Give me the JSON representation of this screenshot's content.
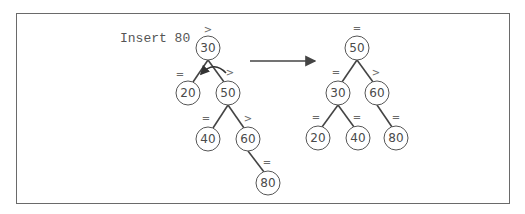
{
  "caption": "Insert 80",
  "colors": {
    "node_stroke": "#555555",
    "edge": "#444444",
    "text": "#4a4a4a",
    "frame": "#6a6a6a"
  },
  "before_tree": {
    "label": "before",
    "nodes": [
      {
        "id": "b30",
        "value": "30",
        "balance": ">",
        "x": 208,
        "y": 48
      },
      {
        "id": "b20",
        "value": "20",
        "balance": "=",
        "x": 188,
        "y": 93
      },
      {
        "id": "b50",
        "value": "50",
        "balance": ">",
        "x": 228,
        "y": 93
      },
      {
        "id": "b40",
        "value": "40",
        "balance": "=",
        "x": 208,
        "y": 139
      },
      {
        "id": "b60",
        "value": "60",
        "balance": ">",
        "x": 248,
        "y": 139
      },
      {
        "id": "b80",
        "value": "80",
        "balance": "=",
        "x": 268,
        "y": 183
      }
    ],
    "edges": [
      [
        "b30",
        "b20"
      ],
      [
        "b30",
        "b50"
      ],
      [
        "b50",
        "b40"
      ],
      [
        "b50",
        "b60"
      ],
      [
        "b60",
        "b80"
      ]
    ],
    "rotation_arrow": "left rotation at 30"
  },
  "transition_arrow": "right-arrow",
  "after_tree": {
    "label": "after",
    "nodes": [
      {
        "id": "a50",
        "value": "50",
        "balance": "=",
        "x": 357,
        "y": 48
      },
      {
        "id": "a30",
        "value": "30",
        "balance": "=",
        "x": 338,
        "y": 93
      },
      {
        "id": "a60",
        "value": "60",
        "balance": ">",
        "x": 377,
        "y": 93
      },
      {
        "id": "a20",
        "value": "20",
        "balance": "=",
        "x": 318,
        "y": 138
      },
      {
        "id": "a40",
        "value": "40",
        "balance": "=",
        "x": 358,
        "y": 138
      },
      {
        "id": "a80",
        "value": "80",
        "balance": "=",
        "x": 396,
        "y": 138
      }
    ],
    "edges": [
      [
        "a50",
        "a30"
      ],
      [
        "a50",
        "a60"
      ],
      [
        "a30",
        "a20"
      ],
      [
        "a30",
        "a40"
      ],
      [
        "a60",
        "a80"
      ]
    ]
  }
}
